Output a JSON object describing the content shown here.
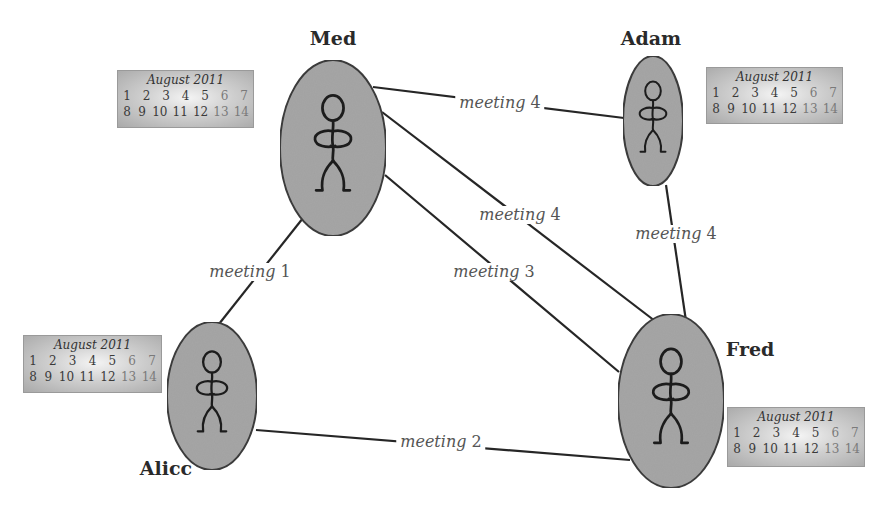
{
  "diagram": {
    "colors": {
      "node_fill": "#a6a6a6",
      "node_stroke": "#3c3c3c",
      "edge": "#262626",
      "label_text": "#555555",
      "name_text": "#2a2a2a"
    },
    "people": [
      {
        "id": "med",
        "name": "Med",
        "cx": 333,
        "cy": 148,
        "rx": 53,
        "ry": 88,
        "label_x": 333,
        "label_y": 38
      },
      {
        "id": "adam",
        "name": "Adam",
        "cx": 653,
        "cy": 121,
        "rx": 30,
        "ry": 65,
        "label_x": 651,
        "label_y": 38
      },
      {
        "id": "alice",
        "name": "Alicc",
        "cx": 212,
        "cy": 396,
        "rx": 45,
        "ry": 74,
        "label_x": 166,
        "label_y": 468
      },
      {
        "id": "fred",
        "name": "Fred",
        "cx": 671,
        "cy": 401,
        "rx": 53,
        "ry": 87,
        "label_x": 750,
        "label_y": 349
      }
    ],
    "edges": [
      {
        "id": "med-adam",
        "from": "Med",
        "to": "Adam",
        "label_word": "meeting",
        "label_num": "4",
        "x1": 373,
        "y1": 87,
        "x2": 624,
        "y2": 118,
        "lx": 500,
        "ly": 103
      },
      {
        "id": "med-fred-upper",
        "from": "Med",
        "to": "Fred",
        "label_word": "meeting",
        "label_num": "4",
        "x1": 382,
        "y1": 112,
        "x2": 655,
        "y2": 321,
        "lx": 520,
        "ly": 215
      },
      {
        "id": "med-fred-lower",
        "from": "Med",
        "to": "Fred",
        "label_word": "meeting",
        "label_num": "3",
        "x1": 385,
        "y1": 175,
        "x2": 619,
        "y2": 372,
        "lx": 494,
        "ly": 272
      },
      {
        "id": "adam-fred",
        "from": "Adam",
        "to": "Fred",
        "label_word": "meeting",
        "label_num": "4",
        "x1": 666,
        "y1": 185,
        "x2": 686,
        "y2": 321,
        "lx": 676,
        "ly": 234
      },
      {
        "id": "med-alice",
        "from": "Med",
        "to": "Alicc",
        "label_word": "meeting",
        "label_num": "1",
        "x1": 307,
        "y1": 213,
        "x2": 219,
        "y2": 324,
        "lx": 250,
        "ly": 272
      },
      {
        "id": "alice-fred",
        "from": "Alicc",
        "to": "Fred",
        "label_word": "meeting",
        "label_num": "2",
        "x1": 256,
        "y1": 430,
        "x2": 630,
        "y2": 460,
        "lx": 441,
        "ly": 442
      }
    ],
    "calendars": [
      {
        "id": "cal-med",
        "owner": "Med",
        "title": "August 2011",
        "x": 117,
        "y": 70,
        "w": 137,
        "h": 58,
        "week1": [
          "1",
          "2",
          "3",
          "4",
          "5",
          "6",
          "7"
        ],
        "week2": [
          "8",
          "9",
          "10",
          "11",
          "12",
          "13",
          "14"
        ]
      },
      {
        "id": "cal-adam",
        "owner": "Adam",
        "title": "August 2011",
        "x": 706,
        "y": 67,
        "w": 137,
        "h": 57,
        "week1": [
          "1",
          "2",
          "3",
          "4",
          "5",
          "6",
          "7"
        ],
        "week2": [
          "8",
          "9",
          "10",
          "11",
          "12",
          "13",
          "14"
        ]
      },
      {
        "id": "cal-alice",
        "owner": "Alicc",
        "title": "August 2011",
        "x": 23,
        "y": 335,
        "w": 139,
        "h": 58,
        "week1": [
          "1",
          "2",
          "3",
          "4",
          "5",
          "6",
          "7"
        ],
        "week2": [
          "8",
          "9",
          "10",
          "11",
          "12",
          "13",
          "14"
        ]
      },
      {
        "id": "cal-fred",
        "owner": "Fred",
        "title": "August 2011",
        "x": 727,
        "y": 407,
        "w": 138,
        "h": 60,
        "week1": [
          "1",
          "2",
          "3",
          "4",
          "5",
          "6",
          "7"
        ],
        "week2": [
          "8",
          "9",
          "10",
          "11",
          "12",
          "13",
          "14"
        ]
      }
    ]
  }
}
